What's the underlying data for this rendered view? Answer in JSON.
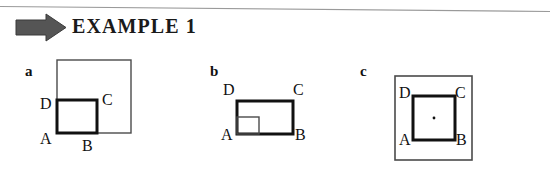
{
  "header": {
    "arrow_icon": "right-arrow-icon",
    "arrow_color": "#555555",
    "title": "EXAMPLE 1"
  },
  "rule": {
    "color": "#9a9a9a"
  },
  "figure": {
    "stroke_color": "#111111",
    "thin_stroke_color": "#4a4a4a",
    "panels": [
      {
        "letter": "a",
        "description": "large thin square with smaller bold square at its lower-left corner",
        "vertices": [
          "D",
          "C",
          "A",
          "B"
        ],
        "labels": {
          "top_left": "D",
          "top_right": "C",
          "bottom_left": "A",
          "bottom_right": "B"
        }
      },
      {
        "letter": "b",
        "description": "bold square with a small thin square at its lower-left corner",
        "vertices": [
          "D",
          "C",
          "A",
          "B"
        ],
        "labels": {
          "top_left": "D",
          "top_right": "C",
          "bottom_left": "A",
          "bottom_right": "B"
        }
      },
      {
        "letter": "c",
        "description": "thin outer rectangle enclosing a centered bold square with a center dot",
        "vertices": [
          "D",
          "C",
          "A",
          "B"
        ],
        "labels": {
          "top_left": "D",
          "top_right": "C",
          "bottom_left": "A",
          "bottom_right": "B"
        },
        "center_dot": true
      }
    ]
  }
}
